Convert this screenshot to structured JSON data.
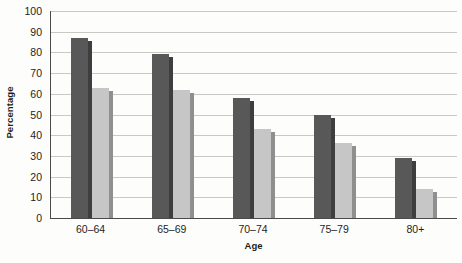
{
  "chart_data": {
    "type": "bar",
    "title": "",
    "subtitle": "",
    "xlabel": "Age",
    "ylabel": "Percentage",
    "categories": [
      "60–64",
      "65–69",
      "70–74",
      "75–79",
      "80+"
    ],
    "series": [
      {
        "name": "series-1-dark",
        "color": "#585858",
        "values": [
          87,
          79,
          58,
          50,
          29
        ]
      },
      {
        "name": "series-2-light",
        "color": "#c6c6c6",
        "values": [
          63,
          62,
          43,
          36,
          14
        ]
      }
    ],
    "ylim": [
      0,
      100
    ],
    "yticks": [
      0,
      10,
      20,
      30,
      40,
      50,
      60,
      70,
      80,
      90,
      100
    ],
    "ytick_labels": [
      "0",
      "10",
      "20",
      "30",
      "40",
      "50",
      "60",
      "70",
      "80",
      "90",
      "100"
    ],
    "grid": "horizontal",
    "legend": "none",
    "background_color": "#fdfdfb",
    "gridline_color": "#c9c9c4",
    "axis_color": "#4a4a4a"
  }
}
